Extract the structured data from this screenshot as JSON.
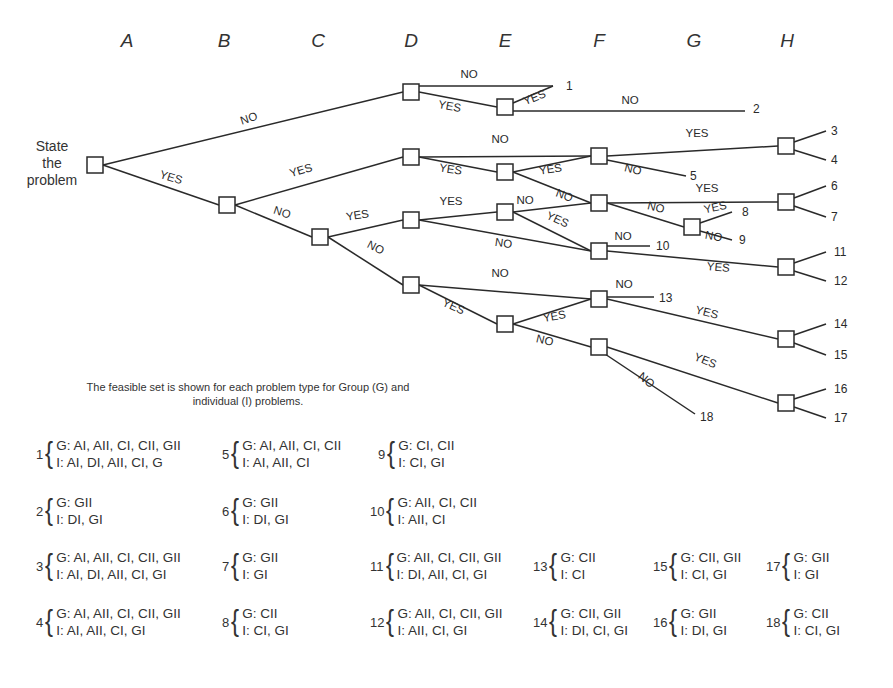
{
  "column_labels": [
    "A",
    "B",
    "C",
    "D",
    "E",
    "F",
    "G",
    "H"
  ],
  "root_label": [
    "State",
    "the",
    "problem"
  ],
  "caption": [
    "The feasible set is shown for each problem type for Group (G) and",
    "individual (I) problems."
  ],
  "tree": {
    "nodes": [
      {
        "id": "root",
        "x": 95,
        "y": 165
      },
      {
        "id": "B1",
        "x": 227,
        "y": 205
      },
      {
        "id": "C1",
        "x": 320,
        "y": 237
      },
      {
        "id": "D1",
        "x": 411,
        "y": 92
      },
      {
        "id": "D2",
        "x": 411,
        "y": 157
      },
      {
        "id": "D3",
        "x": 411,
        "y": 220
      },
      {
        "id": "D4",
        "x": 411,
        "y": 285
      },
      {
        "id": "E1",
        "x": 505,
        "y": 107
      },
      {
        "id": "E2",
        "x": 505,
        "y": 172
      },
      {
        "id": "E3",
        "x": 505,
        "y": 212
      },
      {
        "id": "E4",
        "x": 505,
        "y": 324
      },
      {
        "id": "F1",
        "x": 599,
        "y": 156
      },
      {
        "id": "F2",
        "x": 599,
        "y": 203
      },
      {
        "id": "F3",
        "x": 599,
        "y": 251
      },
      {
        "id": "F4",
        "x": 599,
        "y": 299
      },
      {
        "id": "F5",
        "x": 599,
        "y": 347
      },
      {
        "id": "G1",
        "x": 692,
        "y": 227
      },
      {
        "id": "H1",
        "x": 786,
        "y": 146
      },
      {
        "id": "H2",
        "x": 786,
        "y": 202
      },
      {
        "id": "H3",
        "x": 786,
        "y": 267
      },
      {
        "id": "H4",
        "x": 786,
        "y": 339
      },
      {
        "id": "H5",
        "x": 786,
        "y": 403
      }
    ],
    "edges": [
      {
        "from": "root",
        "to": "D1",
        "label": "NO",
        "lx": 250,
        "ly": 122,
        "rot": -18
      },
      {
        "from": "root",
        "to": "B1",
        "label": "YES",
        "lx": 170,
        "ly": 181,
        "rot": 17
      },
      {
        "from": "B1",
        "to": "D2",
        "label": "YES",
        "lx": 302,
        "ly": 174,
        "rot": -17
      },
      {
        "from": "B1",
        "to": "C1",
        "label": "NO",
        "lx": 281,
        "ly": 216,
        "rot": 18
      },
      {
        "from": "C1",
        "to": "D3",
        "label": "YES",
        "lx": 358,
        "ly": 219,
        "rot": -9
      },
      {
        "from": "C1",
        "to": "D4",
        "label": "NO",
        "lx": 374,
        "ly": 251,
        "rot": 27
      },
      {
        "from": "D1",
        "to": "END1",
        "label": "NO",
        "lx": 469,
        "ly": 78,
        "rot": 0
      },
      {
        "from": "D1",
        "to": "E1",
        "label": "YES",
        "lx": 449,
        "ly": 110,
        "rot": 10
      },
      {
        "from": "E1",
        "to": "END1b",
        "label": "YES",
        "lx": 536,
        "ly": 101,
        "rot": -22
      },
      {
        "from": "E1",
        "to": "END2",
        "label": "NO",
        "lx": 630,
        "ly": 104,
        "rot": 0
      },
      {
        "from": "D2",
        "to": "F1",
        "label": "NO",
        "lx": 500,
        "ly": 143,
        "rot": 0
      },
      {
        "from": "D2",
        "to": "E2",
        "label": "YES",
        "lx": 450,
        "ly": 173,
        "rot": 9
      },
      {
        "from": "E2",
        "to": "F1",
        "label": "YES",
        "lx": 551,
        "ly": 173,
        "rot": -9
      },
      {
        "from": "E2",
        "to": "F2",
        "label": "NO",
        "lx": 563,
        "ly": 199,
        "rot": 20
      },
      {
        "from": "F1",
        "to": "H1",
        "label": "YES",
        "lx": 697,
        "ly": 137,
        "rot": 0
      },
      {
        "from": "F1",
        "to": "END5",
        "label": "NO",
        "lx": 632,
        "ly": 173,
        "rot": 14
      },
      {
        "from": "D3",
        "to": "E3",
        "label": "YES",
        "lx": 451,
        "ly": 205,
        "rot": 0
      },
      {
        "from": "D3",
        "to": "F3",
        "label": "NO",
        "lx": 503,
        "ly": 247,
        "rot": 8
      },
      {
        "from": "E3",
        "to": "F2",
        "label": "NO",
        "lx": 525,
        "ly": 204,
        "rot": 0
      },
      {
        "from": "E3",
        "to": "F3",
        "label": "YES",
        "lx": 556,
        "ly": 223,
        "rot": 25
      },
      {
        "from": "F2",
        "to": "H2",
        "label": "YES",
        "lx": 707,
        "ly": 192,
        "rot": 0
      },
      {
        "from": "F2",
        "to": "G1",
        "label": "NO",
        "lx": 655,
        "ly": 211,
        "rot": 14
      },
      {
        "from": "G1",
        "to": "END8",
        "label": "YES",
        "lx": 716,
        "ly": 211,
        "rot": -12
      },
      {
        "from": "G1",
        "to": "END9",
        "label": "NO",
        "lx": 713,
        "ly": 240,
        "rot": 10
      },
      {
        "from": "F3",
        "to": "END10",
        "label": "NO",
        "lx": 623,
        "ly": 240,
        "rot": 0
      },
      {
        "from": "F3",
        "to": "H3",
        "label": "YES",
        "lx": 718,
        "ly": 271,
        "rot": 5
      },
      {
        "from": "D4",
        "to": "F4",
        "label": "NO",
        "lx": 500,
        "ly": 277,
        "rot": 0
      },
      {
        "from": "D4",
        "to": "E4",
        "label": "YES",
        "lx": 452,
        "ly": 310,
        "rot": 25
      },
      {
        "from": "E4",
        "to": "F4",
        "label": "YES",
        "lx": 555,
        "ly": 320,
        "rot": -10
      },
      {
        "from": "E4",
        "to": "F5",
        "label": "NO",
        "lx": 544,
        "ly": 344,
        "rot": 13
      },
      {
        "from": "F4",
        "to": "END13",
        "label": "NO",
        "lx": 624,
        "ly": 288,
        "rot": 0
      },
      {
        "from": "F4",
        "to": "H4",
        "label": "YES",
        "lx": 706,
        "ly": 316,
        "rot": 14
      },
      {
        "from": "F5",
        "to": "H5",
        "label": "YES",
        "lx": 704,
        "ly": 364,
        "rot": 22
      },
      {
        "from": "F5",
        "to": "END18",
        "label": "NO",
        "lx": 644,
        "ly": 383,
        "rot": 40
      }
    ],
    "terminals": [
      {
        "num": "1",
        "x": 566,
        "y": 86
      },
      {
        "num": "2",
        "x": 753,
        "y": 109
      },
      {
        "num": "3",
        "x": 831,
        "y": 131
      },
      {
        "num": "4",
        "x": 831,
        "y": 160
      },
      {
        "num": "5",
        "x": 690,
        "y": 176
      },
      {
        "num": "6",
        "x": 831,
        "y": 186
      },
      {
        "num": "7",
        "x": 831,
        "y": 217
      },
      {
        "num": "8",
        "x": 742,
        "y": 212
      },
      {
        "num": "9",
        "x": 739,
        "y": 240
      },
      {
        "num": "10",
        "x": 656,
        "y": 246
      },
      {
        "num": "11",
        "x": 834,
        "y": 252
      },
      {
        "num": "12",
        "x": 834,
        "y": 281
      },
      {
        "num": "13",
        "x": 659,
        "y": 298
      },
      {
        "num": "14",
        "x": 834,
        "y": 324
      },
      {
        "num": "15",
        "x": 834,
        "y": 355
      },
      {
        "num": "16",
        "x": 834,
        "y": 389
      },
      {
        "num": "17",
        "x": 834,
        "y": 418
      },
      {
        "num": "18",
        "x": 700,
        "y": 417
      }
    ],
    "leaf_edges": [
      {
        "x1": 419,
        "y1": 86,
        "x2": 553,
        "y2": 86
      },
      {
        "x1": 513,
        "y1": 103,
        "x2": 553,
        "y2": 86
      },
      {
        "x1": 513,
        "y1": 111,
        "x2": 745,
        "y2": 111
      },
      {
        "x1": 794,
        "y1": 142,
        "x2": 826,
        "y2": 131
      },
      {
        "x1": 794,
        "y1": 150,
        "x2": 826,
        "y2": 160
      },
      {
        "x1": 607,
        "y1": 160,
        "x2": 686,
        "y2": 176
      },
      {
        "x1": 794,
        "y1": 198,
        "x2": 826,
        "y2": 186
      },
      {
        "x1": 794,
        "y1": 206,
        "x2": 826,
        "y2": 217
      },
      {
        "x1": 700,
        "y1": 223,
        "x2": 732,
        "y2": 212
      },
      {
        "x1": 700,
        "y1": 231,
        "x2": 732,
        "y2": 240
      },
      {
        "x1": 607,
        "y1": 246,
        "x2": 650,
        "y2": 246
      },
      {
        "x1": 794,
        "y1": 263,
        "x2": 826,
        "y2": 252
      },
      {
        "x1": 794,
        "y1": 271,
        "x2": 826,
        "y2": 281
      },
      {
        "x1": 607,
        "y1": 297,
        "x2": 654,
        "y2": 297
      },
      {
        "x1": 794,
        "y1": 335,
        "x2": 826,
        "y2": 324
      },
      {
        "x1": 794,
        "y1": 343,
        "x2": 826,
        "y2": 355
      },
      {
        "x1": 794,
        "y1": 399,
        "x2": 826,
        "y2": 389
      },
      {
        "x1": 794,
        "y1": 407,
        "x2": 826,
        "y2": 418
      },
      {
        "x1": 605,
        "y1": 354,
        "x2": 695,
        "y2": 414
      }
    ]
  },
  "feasible_sets": [
    {
      "num": "1",
      "G": "G: AI, AII, CI, CII, GII",
      "I": "I: AI, DI, AII, CI, G",
      "x": 36,
      "y": 455
    },
    {
      "num": "5",
      "G": "G: AI, AII, CI, CII",
      "I": "I: AI, AII, CI",
      "x": 222,
      "y": 455
    },
    {
      "num": "9",
      "G": "G: CI, CII",
      "I": "I: CI, GI",
      "x": 378,
      "y": 455
    },
    {
      "num": "2",
      "G": "G: GII",
      "I": "I: DI, GI",
      "x": 36,
      "y": 512
    },
    {
      "num": "6",
      "G": "G: GII",
      "I": "I: DI, GI",
      "x": 222,
      "y": 512
    },
    {
      "num": "10",
      "G": "G: AII, CI, CII",
      "I": "I: AII, CI",
      "x": 370,
      "y": 512
    },
    {
      "num": "3",
      "G": "G: AI, AII, CI, CII, GII",
      "I": "I: AI, DI, AII, CI, GI",
      "x": 36,
      "y": 567
    },
    {
      "num": "7",
      "G": "G: GII",
      "I": "I: GI",
      "x": 222,
      "y": 567
    },
    {
      "num": "11",
      "G": "G: AII, CI, CII, GII",
      "I": "I: DI, AII, CI, GI",
      "x": 370,
      "y": 567
    },
    {
      "num": "13",
      "G": "G: CII",
      "I": "I: CI",
      "x": 533,
      "y": 567
    },
    {
      "num": "15",
      "G": "G: CII, GII",
      "I": "I: CI, GI",
      "x": 653,
      "y": 567
    },
    {
      "num": "17",
      "G": "G: GII",
      "I": "I: GI",
      "x": 766,
      "y": 567
    },
    {
      "num": "4",
      "G": "G: AI, AII, CI, CII, GII",
      "I": "I: AI, AII, CI, GI",
      "x": 36,
      "y": 623
    },
    {
      "num": "8",
      "G": "G: CII",
      "I": "I: CI, GI",
      "x": 222,
      "y": 623
    },
    {
      "num": "12",
      "G": "G: AII, CI, CII, GII",
      "I": "I: AII, CI, GI",
      "x": 370,
      "y": 623
    },
    {
      "num": "14",
      "G": "G: CII, GII",
      "I": "I: DI, CI, GI",
      "x": 533,
      "y": 623
    },
    {
      "num": "16",
      "G": "G: GII",
      "I": "I: DI, GI",
      "x": 653,
      "y": 623
    },
    {
      "num": "18",
      "G": "G: CII",
      "I": "I: CI, GI",
      "x": 766,
      "y": 623
    }
  ],
  "colors": {
    "ink": "#2a2a2a",
    "background": "#ffffff"
  }
}
